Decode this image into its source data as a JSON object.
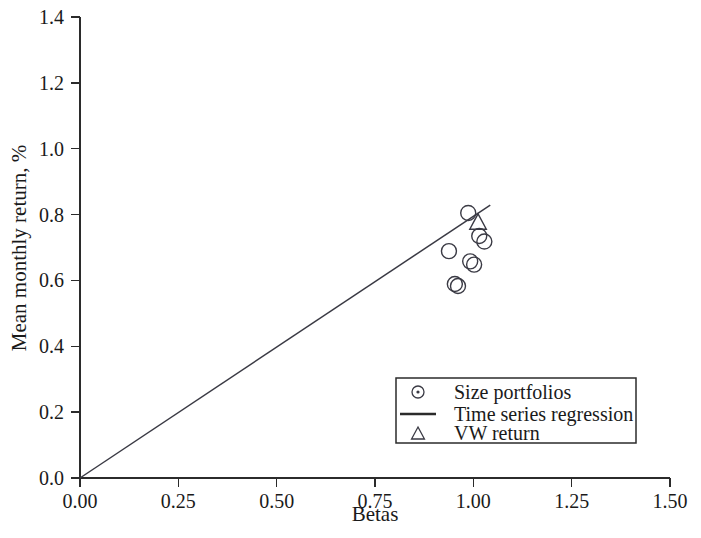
{
  "chart_data": {
    "type": "scatter",
    "title": "",
    "xlabel": "Betas",
    "ylabel": "Mean monthly return, %",
    "xlim": [
      0.0,
      1.5
    ],
    "ylim": [
      0.0,
      1.4
    ],
    "xticks": [
      "0.00",
      "0.25",
      "0.50",
      "0.75",
      "1.00",
      "1.25",
      "1.50"
    ],
    "xtick_values": [
      0.0,
      0.25,
      0.5,
      0.75,
      1.0,
      1.25,
      1.5
    ],
    "yticks": [
      "0.0",
      "0.2",
      "0.4",
      "0.6",
      "0.8",
      "1.0",
      "1.2",
      "1.4"
    ],
    "ytick_values": [
      0.0,
      0.2,
      0.4,
      0.6,
      0.8,
      1.0,
      1.2,
      1.4
    ],
    "grid": false,
    "legend_position": "lower right",
    "series": [
      {
        "name": "Size portfolios",
        "marker": "circle",
        "points": [
          {
            "x": 0.938,
            "y": 0.689
          },
          {
            "x": 0.987,
            "y": 0.805
          },
          {
            "x": 1.015,
            "y": 0.735
          },
          {
            "x": 1.028,
            "y": 0.718
          },
          {
            "x": 0.992,
            "y": 0.658
          },
          {
            "x": 1.002,
            "y": 0.648
          },
          {
            "x": 0.953,
            "y": 0.589
          },
          {
            "x": 0.961,
            "y": 0.583
          }
        ]
      },
      {
        "name": "VW return",
        "marker": "triangle",
        "points": [
          {
            "x": 1.012,
            "y": 0.775
          }
        ]
      },
      {
        "name": "Time series regression",
        "marker": "line",
        "line": {
          "x0": 0.0,
          "y0": 0.0,
          "x1": 1.043,
          "y1": 0.829
        }
      }
    ]
  },
  "legend": {
    "items": [
      {
        "label": "Size portfolios",
        "symbol": "circle"
      },
      {
        "label": "Time series regression",
        "symbol": "line"
      },
      {
        "label": "VW return",
        "symbol": "triangle"
      }
    ]
  }
}
